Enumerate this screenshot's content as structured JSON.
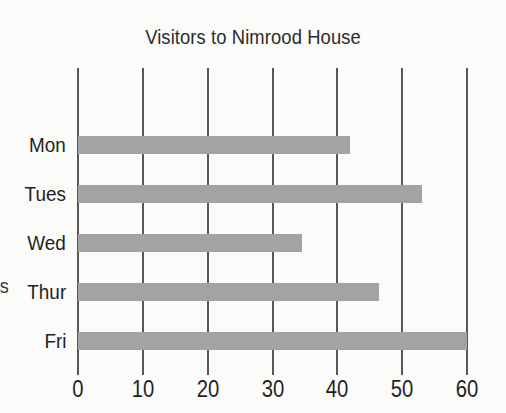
{
  "chart_data": {
    "type": "bar",
    "orientation": "horizontal",
    "title": "Visitors to Nimrood House",
    "xlabel": "",
    "ylabel": "",
    "categories": [
      "Mon",
      "Tues",
      "Wed",
      "Thur",
      "Fri"
    ],
    "values": [
      42,
      53,
      34.5,
      46.5,
      60
    ],
    "xlim": [
      0,
      60
    ],
    "xticks": [
      0,
      10,
      20,
      30,
      40,
      50,
      60
    ],
    "xtick_labels": [
      "0",
      "10",
      "20",
      "30",
      "40",
      "50",
      "60"
    ],
    "grid": true,
    "grid_axis": "x",
    "legend": false,
    "series": [
      {
        "name": "Visitors",
        "values": [
          42,
          53,
          34.5,
          46.5,
          60
        ]
      }
    ],
    "bar_color": "#a3a3a3",
    "gridline_color": "#585858",
    "text_color": "#1f1f1f",
    "background_color": "#fbfbf9"
  },
  "annotations": {
    "cropped_axis_label_fragment": "s"
  }
}
